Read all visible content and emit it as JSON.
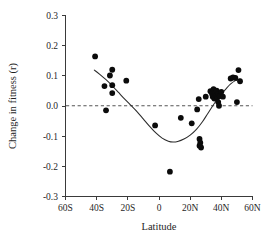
{
  "figure": {
    "background_color": "#ffffff",
    "point_color": "#0b0b0b",
    "axis_color": "#3a3a3a",
    "zero_line_color": "#555555",
    "curve_color": "#2b2b2b"
  },
  "chart_data": {
    "type": "scatter",
    "title": "",
    "subtitle": "",
    "xlabel": "Latitude",
    "ylabel": "Change in fitness (r)",
    "xlim": [
      -60,
      60
    ],
    "ylim": [
      -0.3,
      0.3
    ],
    "xticks": [
      -60,
      -40,
      -20,
      0,
      20,
      40,
      60
    ],
    "xtick_labels": [
      "60S",
      "40S",
      "20S",
      "0",
      "20N",
      "40N",
      "60N"
    ],
    "yticks": [
      0.3,
      0.2,
      0.1,
      0.0,
      -0.1,
      -0.2,
      -0.3
    ],
    "ytick_labels": [
      "0.3",
      "0.2",
      "0.1",
      "0.0",
      "-0.1",
      "-0.2",
      "-0.3"
    ],
    "grid": false,
    "legend": null,
    "annotations": [
      {
        "name": "zero-reference-line",
        "type": "hline",
        "y": 0.0,
        "style": "dashed"
      }
    ],
    "series": [
      {
        "name": "Change in fitness by latitude",
        "marker": "filled-circle",
        "points": [
          {
            "x": -41.0,
            "y": 0.163
          },
          {
            "x": -35.0,
            "y": 0.065
          },
          {
            "x": -34.0,
            "y": -0.015
          },
          {
            "x": -31.5,
            "y": 0.1
          },
          {
            "x": -30.0,
            "y": 0.119
          },
          {
            "x": -30.0,
            "y": 0.068
          },
          {
            "x": -30.0,
            "y": 0.042
          },
          {
            "x": -21.0,
            "y": 0.083
          },
          {
            "x": -2.5,
            "y": -0.065
          },
          {
            "x": 7.0,
            "y": -0.218
          },
          {
            "x": 14.0,
            "y": -0.04
          },
          {
            "x": 21.0,
            "y": -0.058
          },
          {
            "x": 24.5,
            "y": -0.012
          },
          {
            "x": 25.5,
            "y": 0.022
          },
          {
            "x": 26.0,
            "y": -0.11
          },
          {
            "x": 26.5,
            "y": -0.122
          },
          {
            "x": 26.0,
            "y": -0.132
          },
          {
            "x": 27.0,
            "y": -0.138
          },
          {
            "x": 30.0,
            "y": 0.03
          },
          {
            "x": 33.0,
            "y": 0.048
          },
          {
            "x": 34.0,
            "y": 0.04
          },
          {
            "x": 34.5,
            "y": 0.03
          },
          {
            "x": 35.0,
            "y": 0.055
          },
          {
            "x": 35.5,
            "y": 0.024
          },
          {
            "x": 36.0,
            "y": 0.043
          },
          {
            "x": 36.5,
            "y": 0.034
          },
          {
            "x": 37.0,
            "y": 0.05
          },
          {
            "x": 37.5,
            "y": 0.028
          },
          {
            "x": 38.0,
            "y": 0.038
          },
          {
            "x": 38.0,
            "y": 0.012
          },
          {
            "x": 38.5,
            "y": 0.0
          },
          {
            "x": 39.0,
            "y": 0.032
          },
          {
            "x": 40.0,
            "y": 0.046
          },
          {
            "x": 41.0,
            "y": 0.03
          },
          {
            "x": 46.0,
            "y": 0.09
          },
          {
            "x": 47.5,
            "y": 0.094
          },
          {
            "x": 49.0,
            "y": 0.092
          },
          {
            "x": 50.0,
            "y": 0.012
          },
          {
            "x": 51.0,
            "y": 0.118
          },
          {
            "x": 52.0,
            "y": 0.081
          }
        ]
      }
    ],
    "fit_curve": {
      "name": "smoothed-trend-line",
      "points": [
        {
          "x": -41.5,
          "y": 0.118
        },
        {
          "x": -38.0,
          "y": 0.104
        },
        {
          "x": -34.0,
          "y": 0.086
        },
        {
          "x": -30.0,
          "y": 0.066
        },
        {
          "x": -26.0,
          "y": 0.044
        },
        {
          "x": -22.0,
          "y": 0.022
        },
        {
          "x": -18.0,
          "y": 0.001
        },
        {
          "x": -14.0,
          "y": -0.02
        },
        {
          "x": -10.0,
          "y": -0.044
        },
        {
          "x": -6.0,
          "y": -0.068
        },
        {
          "x": -2.0,
          "y": -0.09
        },
        {
          "x": 2.0,
          "y": -0.107
        },
        {
          "x": 6.0,
          "y": -0.117
        },
        {
          "x": 9.0,
          "y": -0.12
        },
        {
          "x": 12.0,
          "y": -0.118
        },
        {
          "x": 16.0,
          "y": -0.11
        },
        {
          "x": 20.0,
          "y": -0.097
        },
        {
          "x": 24.0,
          "y": -0.078
        },
        {
          "x": 28.0,
          "y": -0.052
        },
        {
          "x": 31.0,
          "y": -0.028
        },
        {
          "x": 34.0,
          "y": -0.004
        },
        {
          "x": 37.0,
          "y": 0.018
        },
        {
          "x": 40.0,
          "y": 0.038
        },
        {
          "x": 43.0,
          "y": 0.056
        },
        {
          "x": 46.0,
          "y": 0.072
        },
        {
          "x": 49.0,
          "y": 0.083
        },
        {
          "x": 52.0,
          "y": 0.088
        }
      ]
    }
  }
}
